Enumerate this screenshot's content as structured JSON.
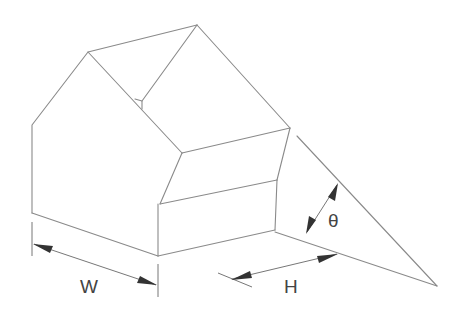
{
  "figure": {
    "labels": {
      "width": "W",
      "height": "H",
      "angle": "θ"
    },
    "colors": {
      "edge": "#8a8a8a",
      "arrow": "#333333",
      "text": "#444444",
      "background": "#ffffff"
    }
  }
}
